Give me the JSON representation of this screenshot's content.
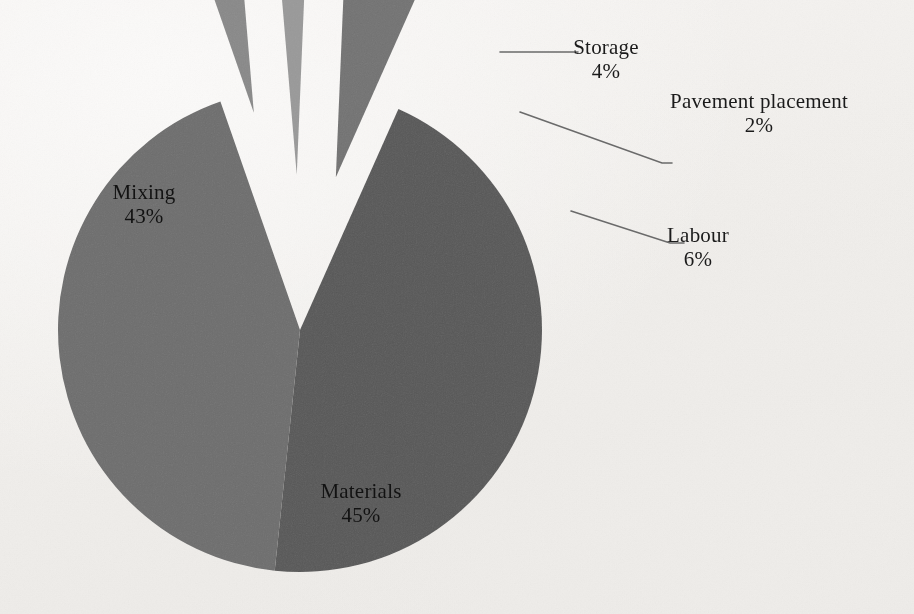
{
  "chart_data": {
    "type": "pie",
    "title": "",
    "subtitle": "",
    "xlabel": "",
    "ylabel": "",
    "legend_position": "none",
    "grid": false,
    "labels_show_percent": true,
    "categories": [
      "Materials",
      "Mixing",
      "Labour",
      "Storage",
      "Pavement placement"
    ],
    "values": [
      45,
      43,
      6,
      4,
      2
    ],
    "units": "%",
    "colors": [
      "#585858",
      "#6e6e6e",
      "#737373",
      "#8a8a8a",
      "#9a9a9a"
    ],
    "exploded": [
      false,
      false,
      true,
      true,
      true
    ],
    "label_placement": [
      "inside",
      "inside",
      "outside-leader",
      "outside-leader",
      "outside-leader"
    ],
    "slices": [
      {
        "name": "Materials",
        "value": 45,
        "label": "Materials",
        "percent_text": "45%",
        "color": "#585858",
        "exploded": false
      },
      {
        "name": "Mixing",
        "value": 43,
        "label": "Mixing",
        "percent_text": "43%",
        "color": "#6e6e6e",
        "exploded": false
      },
      {
        "name": "Labour",
        "value": 6,
        "label": "Labour",
        "percent_text": "6%",
        "color": "#737373",
        "exploded": true
      },
      {
        "name": "Storage",
        "value": 4,
        "label": "Storage",
        "percent_text": "4%",
        "color": "#8a8a8a",
        "exploded": true
      },
      {
        "name": "Pavement placement",
        "value": 2,
        "label": "Pavement placement",
        "percent_text": "2%",
        "color": "#9a9a9a",
        "exploded": true
      }
    ]
  },
  "labels": {
    "mixing": {
      "name": "Mixing",
      "percent": "43%"
    },
    "materials": {
      "name": "Materials",
      "percent": "45%"
    },
    "storage": {
      "name": "Storage",
      "percent": "4%"
    },
    "pavement": {
      "name": "Pavement placement",
      "percent": "2%"
    },
    "labour": {
      "name": "Labour",
      "percent": "6%"
    }
  },
  "style": {
    "background_color": "#f2f0ed",
    "text_color": "#1b1b1b",
    "leader_line_color": "#6b6b6b"
  }
}
